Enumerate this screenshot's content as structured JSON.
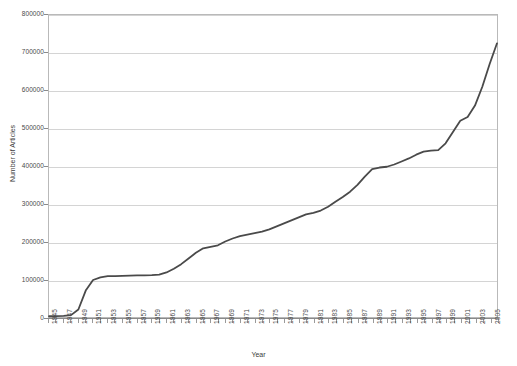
{
  "chart_data": {
    "type": "line",
    "title": "",
    "xlabel": "Year",
    "ylabel": "Number of Articles",
    "xlim": [
      1945,
      2006
    ],
    "ylim": [
      0,
      800000
    ],
    "grid": true,
    "legend": false,
    "legend_position": "none",
    "line_color": "#4a4a4a",
    "y_ticks": [
      0,
      100000,
      200000,
      300000,
      400000,
      500000,
      600000,
      700000,
      800000
    ],
    "y_tick_labels": [
      "0",
      "100000",
      "200000",
      "300000",
      "400000",
      "500000",
      "600000",
      "700000",
      "800000"
    ],
    "x_tick_labels": [
      "1945",
      "1947",
      "1949",
      "1951",
      "1953",
      "1955",
      "1957",
      "1959",
      "1961",
      "1963",
      "1965",
      "1967",
      "1969",
      "1971",
      "1973",
      "1975",
      "1977",
      "1979",
      "1981",
      "1983",
      "1985",
      "1987",
      "1989",
      "1991",
      "1993",
      "1995",
      "1997",
      "1999",
      "2001",
      "2003",
      "2005"
    ],
    "x": [
      1945,
      1946,
      1947,
      1948,
      1949,
      1950,
      1951,
      1952,
      1953,
      1954,
      1955,
      1956,
      1957,
      1958,
      1959,
      1960,
      1961,
      1962,
      1963,
      1964,
      1965,
      1966,
      1967,
      1968,
      1969,
      1970,
      1971,
      1972,
      1973,
      1974,
      1975,
      1976,
      1977,
      1978,
      1979,
      1980,
      1981,
      1982,
      1983,
      1984,
      1985,
      1986,
      1987,
      1988,
      1989,
      1990,
      1991,
      1992,
      1993,
      1994,
      1995,
      1996,
      1997,
      1998,
      1999,
      2000,
      2001,
      2002,
      2003,
      2004,
      2005,
      2006
    ],
    "values": [
      2000,
      2500,
      3000,
      5000,
      20000,
      70000,
      98000,
      105000,
      108000,
      108500,
      109000,
      109500,
      110000,
      110500,
      111000,
      112000,
      118000,
      128000,
      140000,
      155000,
      170000,
      182000,
      186000,
      190000,
      200000,
      208000,
      214000,
      218000,
      222000,
      226000,
      232000,
      240000,
      248000,
      256000,
      264000,
      272000,
      276000,
      282000,
      292000,
      305000,
      318000,
      332000,
      350000,
      372000,
      392000,
      396000,
      398000,
      404000,
      412000,
      420000,
      430000,
      438000,
      441000,
      442000,
      460000,
      490000,
      520000,
      530000,
      560000,
      610000,
      670000,
      725000
    ]
  }
}
